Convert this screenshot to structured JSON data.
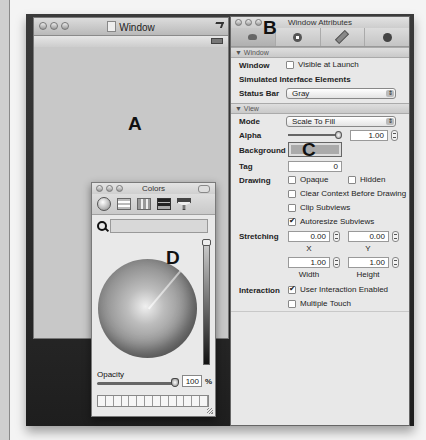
{
  "labels": {
    "a": "A",
    "b": "B",
    "c": "C",
    "d": "D"
  },
  "window": {
    "title": "Window",
    "icons": [
      "document-icon",
      "zoom-icon",
      "battery-icon"
    ]
  },
  "colors_panel": {
    "title": "Colors",
    "modes": [
      "color-wheel",
      "color-sliders",
      "color-palettes",
      "image-palettes",
      "crayons"
    ],
    "search_placeholder": "",
    "opacity_label": "Opacity",
    "opacity_value": "100",
    "opacity_unit": "%",
    "swatch_count": 14
  },
  "inspector": {
    "title": "Window Attributes",
    "tabs": [
      "attributes",
      "connections",
      "size",
      "identity"
    ],
    "sections": {
      "window": {
        "header": "▼ Window",
        "window_label": "Window",
        "visible_at_launch": "Visible at Launch",
        "simulated_label": "Simulated Interface Elements",
        "status_bar_label": "Status Bar",
        "status_bar_value": "Gray"
      },
      "view": {
        "header": "▼ View",
        "mode_label": "Mode",
        "mode_value": "Scale To Fill",
        "alpha_label": "Alpha",
        "alpha_value": "1.00",
        "background_label": "Background",
        "tag_label": "Tag",
        "tag_value": "0",
        "drawing_label": "Drawing",
        "opaque": "Opaque",
        "hidden": "Hidden",
        "clear_context": "Clear Context Before Drawing",
        "clip_subviews": "Clip Subviews",
        "autoresize": "Autoresize Subviews",
        "stretching_label": "Stretching",
        "x_value": "0.00",
        "x_label": "X",
        "y_value": "0.00",
        "y_label": "Y",
        "width_value": "1.00",
        "width_label": "Width",
        "height_value": "1.00",
        "height_label": "Height",
        "interaction_label": "Interaction",
        "user_interaction": "User Interaction Enabled",
        "multiple_touch": "Multiple Touch"
      }
    }
  }
}
